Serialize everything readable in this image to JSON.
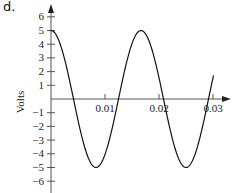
{
  "panel_label": "d.",
  "chart_data": {
    "type": "line",
    "title": "",
    "xlabel": "",
    "ylabel": "Volts",
    "xlim": [
      0,
      0.0315
    ],
    "ylim": [
      -6.9,
      6.6
    ],
    "x_ticks": [
      0.01,
      0.02,
      0.03
    ],
    "x_tick_labels": [
      "0.01",
      "0.02",
      "0.03"
    ],
    "y_ticks": [
      -6,
      -5,
      -4,
      -3,
      -2,
      -1,
      1,
      2,
      3,
      4,
      5,
      6
    ],
    "y_tick_labels": [
      "−6",
      "−5",
      "−4",
      "−3",
      "−2",
      "−1",
      "1",
      "2",
      "3",
      "4",
      "5",
      "6"
    ],
    "grid": false,
    "legend": null,
    "series": [
      {
        "name": "v(t) = 5 cos(2π·60·t)",
        "amplitude": 5,
        "frequency_hz": 60,
        "x": [
          0,
          0.00208,
          0.00417,
          0.00625,
          0.00833,
          0.01042,
          0.0125,
          0.01458,
          0.01667,
          0.01875,
          0.02083,
          0.02292,
          0.025,
          0.02708,
          0.02917,
          0.03
        ],
        "values": [
          5,
          3.54,
          0,
          -3.54,
          -5,
          -3.54,
          0,
          3.54,
          5,
          3.54,
          0,
          -3.54,
          -5,
          -3.54,
          0,
          1.55
        ]
      }
    ],
    "color": "#111111"
  }
}
